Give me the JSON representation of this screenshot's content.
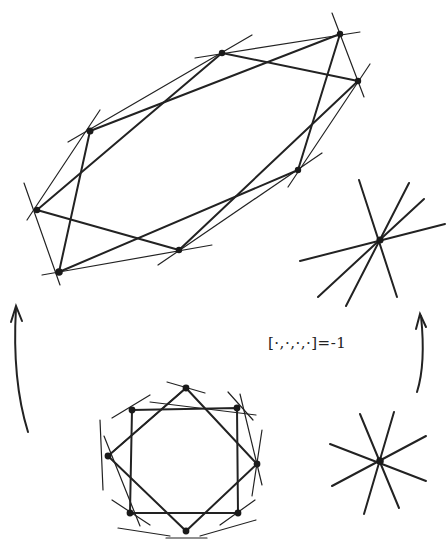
{
  "diagram": {
    "label": "[·,·,·,·]=-1",
    "top_figure": {
      "vertices": [
        [
          222,
          53
        ],
        [
          340,
          34
        ],
        [
          358,
          81
        ],
        [
          298,
          170
        ],
        [
          179,
          250
        ],
        [
          59,
          272
        ],
        [
          37,
          210
        ],
        [
          90,
          131
        ]
      ],
      "description": "hand-drawn octagram configuration with extended lines through vertices"
    },
    "bottom_figure": {
      "vertices": [
        [
          186,
          388
        ],
        [
          237,
          408
        ],
        [
          257,
          464
        ],
        [
          238,
          513
        ],
        [
          186,
          531
        ],
        [
          130,
          513
        ],
        [
          108,
          456
        ],
        [
          132,
          410
        ]
      ],
      "description": "regular octagram (two squares) with tangent lines at vertices"
    },
    "upper_star": {
      "center": [
        380,
        240
      ],
      "lines": [
        [
          [
            359,
            180
          ],
          [
            397,
            297
          ]
        ],
        [
          [
            409,
            183
          ],
          [
            346,
            306
          ]
        ],
        [
          [
            424,
            199
          ],
          [
            318,
            297
          ]
        ],
        [
          [
            445,
            224
          ],
          [
            300,
            261
          ]
        ]
      ]
    },
    "lower_star": {
      "center": [
        380,
        461
      ],
      "lines": [
        [
          [
            360,
            414
          ],
          [
            399,
            508
          ]
        ],
        [
          [
            394,
            412
          ],
          [
            364,
            514
          ]
        ],
        [
          [
            426,
            436
          ],
          [
            332,
            486
          ]
        ],
        [
          [
            330,
            444
          ],
          [
            426,
            481
          ]
        ]
      ]
    },
    "arrows": [
      {
        "name": "left-arrow",
        "from": [
          28,
          432
        ],
        "to": [
          16,
          307
        ]
      },
      {
        "name": "right-arrow",
        "from": [
          417,
          392
        ],
        "to": [
          421,
          315
        ]
      }
    ]
  }
}
